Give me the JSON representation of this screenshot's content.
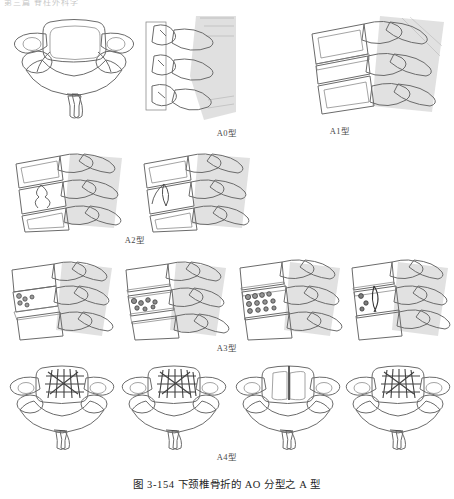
{
  "header": {
    "running_text": "第三篇 脊柱外科学"
  },
  "figure": {
    "caption": "图 3-154  下颈椎骨折的 AO 分型之 A 型",
    "caption_number": "图 3-154",
    "caption_title": "下颈椎骨折的 AO 分型之 A 型"
  },
  "colors": {
    "outline": "#6b6b6b",
    "bone_light": "#e3e3e3",
    "bone_mid": "#c2c2c2",
    "bone_dark": "#8f8f8f",
    "body_gray": "#8a8a8a",
    "soft_tissue": "#cfcfcf",
    "disc_white": "#f2f2f2",
    "fracture_line": "#4a4a4a",
    "page_background": "#ffffff",
    "label_text": "#4a4a4a",
    "caption_text": "#1e1e1e"
  },
  "rows": [
    {
      "id": "a0",
      "label": "A0型",
      "label_top": 126,
      "row_top": 14,
      "panels": [
        {
          "name": "a0-axial-view",
          "view": "axial",
          "x": 10,
          "y": 14,
          "w": 128,
          "h": 108
        },
        {
          "name": "a0-oblique-view",
          "view": "posterior-oblique",
          "x": 144,
          "y": 16,
          "w": 92,
          "h": 104
        }
      ]
    },
    {
      "id": "a1",
      "label": "A1型",
      "label_top": 124,
      "row_top": 16,
      "panels": [
        {
          "name": "a1-lateral-view",
          "view": "lateral",
          "x": 306,
          "y": 16,
          "w": 140,
          "h": 104
        }
      ]
    },
    {
      "id": "a2",
      "label": "A2型",
      "label_top": 233,
      "row_top": 154,
      "panels": [
        {
          "name": "a2-lateral-view-left",
          "view": "lateral",
          "x": 12,
          "y": 154,
          "w": 116,
          "h": 78
        },
        {
          "name": "a2-lateral-view-right",
          "view": "lateral",
          "x": 140,
          "y": 154,
          "w": 116,
          "h": 78
        }
      ]
    },
    {
      "id": "a3",
      "label": "A3型",
      "label_top": 341,
      "row_top": 262,
      "panels": [
        {
          "name": "a3-lateral-view-1",
          "view": "lateral",
          "x": 8,
          "y": 262,
          "w": 110,
          "h": 78
        },
        {
          "name": "a3-lateral-view-2",
          "view": "lateral",
          "x": 122,
          "y": 262,
          "w": 110,
          "h": 78
        },
        {
          "name": "a3-lateral-view-3",
          "view": "lateral",
          "x": 236,
          "y": 262,
          "w": 110,
          "h": 78
        },
        {
          "name": "a3-lateral-view-4",
          "view": "lateral",
          "x": 348,
          "y": 262,
          "w": 104,
          "h": 78
        }
      ]
    },
    {
      "id": "a4",
      "label": "A4型",
      "label_top": 450,
      "row_top": 364,
      "panels": [
        {
          "name": "a4-axial-view-1",
          "view": "axial",
          "x": 8,
          "y": 364,
          "w": 108,
          "h": 84
        },
        {
          "name": "a4-axial-view-2",
          "view": "axial",
          "x": 120,
          "y": 364,
          "w": 108,
          "h": 84
        },
        {
          "name": "a4-axial-view-3",
          "view": "axial",
          "x": 234,
          "y": 364,
          "w": 108,
          "h": 84
        },
        {
          "name": "a4-axial-view-4",
          "view": "axial",
          "x": 344,
          "y": 364,
          "w": 108,
          "h": 84
        }
      ]
    }
  ]
}
